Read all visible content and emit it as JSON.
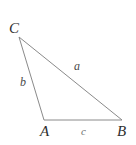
{
  "figure": {
    "kind": "geometry-diagram",
    "shape": "triangle",
    "background_color": "#ffffff",
    "stroke_color": "#8a8a8a",
    "label_color": "#3a3a3a",
    "width": 136,
    "height": 145
  },
  "vertices": [
    {
      "id": "C",
      "label": "C",
      "x": 19,
      "y": 37
    },
    {
      "id": "A",
      "label": "A",
      "x": 44,
      "y": 120
    },
    {
      "id": "B",
      "label": "B",
      "x": 122,
      "y": 120
    }
  ],
  "sides": [
    {
      "id": "a",
      "label": "a",
      "from": "C",
      "to": "B",
      "label_x": 76,
      "label_y": 66
    },
    {
      "id": "b",
      "label": "b",
      "from": "C",
      "to": "A",
      "label_x": 23,
      "label_y": 82
    },
    {
      "id": "c",
      "label": "c",
      "from": "A",
      "to": "B",
      "label_x": 84,
      "label_y": 131
    }
  ],
  "edges": {
    "CB": "19,37 122,120",
    "CA": "19,37 44,120",
    "AB": "44,120 122,120"
  }
}
